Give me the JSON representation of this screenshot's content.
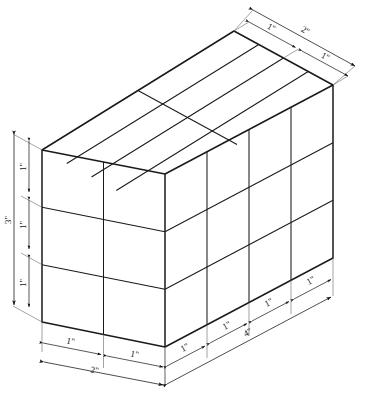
{
  "figure": {
    "kind": "isometric-block-diagram",
    "line_color": "#1a1a1a",
    "face_color": "#ffffff",
    "background": "#ffffff"
  },
  "block": {
    "depth_in": 2,
    "width_in": 4,
    "height_in": 3,
    "unit_label": "1\"",
    "left_face_columns": 2,
    "left_face_rows": 3,
    "right_face_columns": 4,
    "right_face_rows": 3,
    "top_face_cells_x": 4,
    "top_face_cells_y": 2
  },
  "dimensions": {
    "top_right": {
      "outer_label": "2\"",
      "inner_labels": [
        "1\"",
        "1\""
      ]
    },
    "left_vertical": {
      "outer_label": "3\"",
      "inner_labels": [
        "1\"",
        "1\"",
        "1\""
      ]
    },
    "bottom_left": {
      "outer_label": "2\"",
      "inner_labels": [
        "1\"",
        "1\""
      ]
    },
    "bottom_right": {
      "outer_label": "4\"",
      "inner_labels": [
        "1\"",
        "1\"",
        "1\"",
        "1\""
      ]
    }
  },
  "labels": {
    "t_inner_1": "1\"",
    "t_inner_2": "1\"",
    "t_outer": "2\"",
    "v_inner_1": "1\"",
    "v_inner_2": "1\"",
    "v_inner_3": "1\"",
    "v_outer": "3\"",
    "bl_inner_1": "1\"",
    "bl_inner_2": "1\"",
    "bl_outer": "2\"",
    "br_inner_1": "1\"",
    "br_inner_2": "1\"",
    "br_inner_3": "1\"",
    "br_inner_4": "1\"",
    "br_outer": "4\""
  }
}
